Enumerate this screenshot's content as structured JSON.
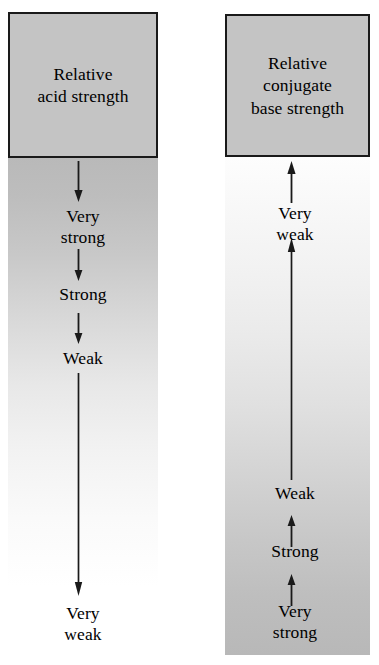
{
  "figure": {
    "background_color": "#ffffff",
    "line_color": "#1a1a1a",
    "box_fill_color": "#c4c4c4"
  },
  "columns": {
    "left": {
      "header": "Relative\nacid strength",
      "header_name": "relative-acid-strength",
      "gradient": {
        "top_color": "#b9b9b9",
        "bottom_color": "#ffffff",
        "direction": "dark-to-light-downward"
      },
      "arrow_direction": "down",
      "scale": [
        {
          "label": "Very\nstrong",
          "rank": 1
        },
        {
          "label": "Strong",
          "rank": 2
        },
        {
          "label": "Weak",
          "rank": 3
        },
        {
          "label": "Very\nweak",
          "rank": 4
        }
      ]
    },
    "right": {
      "header": "Relative\nconjugate\nbase strength",
      "header_name": "relative-conjugate-base-strength",
      "gradient": {
        "top_color": "#fdfdfd",
        "bottom_color": "#b8b8b8",
        "direction": "light-to-dark-downward"
      },
      "arrow_direction": "up",
      "scale": [
        {
          "label": "Very\nweak",
          "rank": 1
        },
        {
          "label": "Weak",
          "rank": 2
        },
        {
          "label": "Strong",
          "rank": 3
        },
        {
          "label": "Very\nstrong",
          "rank": 4
        }
      ]
    }
  }
}
